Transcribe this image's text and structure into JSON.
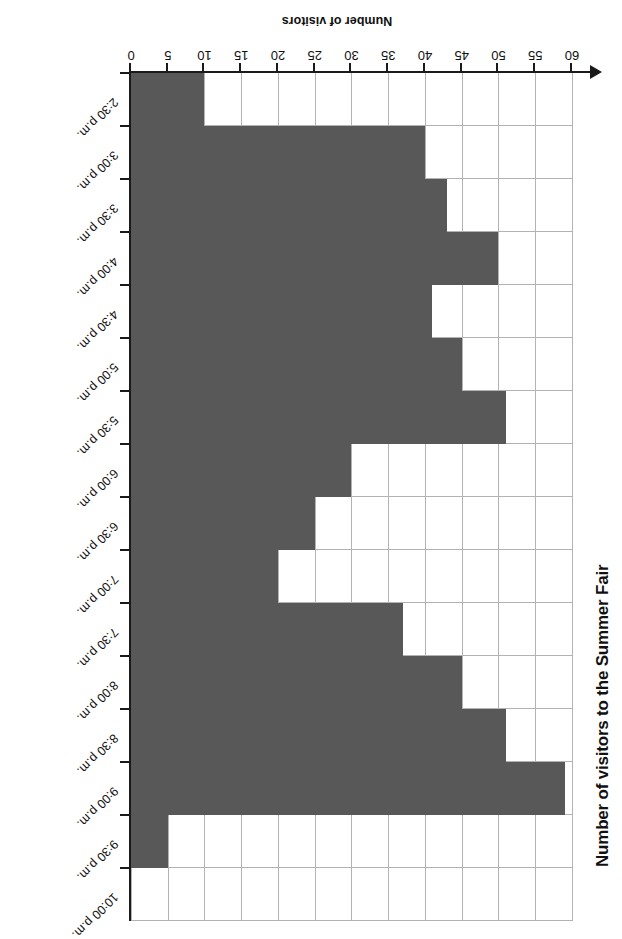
{
  "chart_data": {
    "type": "bar",
    "orientation": "horizontal",
    "title": "Number of visitors to the Summer Fair",
    "xlabel": "Number of visitors",
    "ylabel": "",
    "categories": [
      "2:30 p.m.",
      "3:00 p.m.",
      "3:30 p.m.",
      "4:00 p.m.",
      "4:30 p.m.",
      "5:00 p.m.",
      "5:30 p.m.",
      "6:00 p.m.",
      "6:30 p.m.",
      "7:00 p.m.",
      "7:30 p.m.",
      "8:00 p.m.",
      "8:30 p.m.",
      "9:00 p.m.",
      "9:30 p.m.",
      "10:00 p.m."
    ],
    "values": [
      10,
      40,
      43,
      50,
      41,
      45,
      51,
      30,
      25,
      20,
      37,
      45,
      51,
      59,
      5,
      0
    ],
    "xlim": [
      0,
      60
    ],
    "xticks": [
      0,
      5,
      10,
      15,
      20,
      25,
      30,
      35,
      40,
      45,
      50,
      55,
      60
    ],
    "xtick_labels": [
      "0",
      "5",
      "10",
      "15",
      "20",
      "25",
      "30",
      "35",
      "40",
      "45",
      "50",
      "55",
      "60"
    ],
    "grid": true,
    "legend": false,
    "bar_color": "#585858",
    "grid_color": "#b3b3b3",
    "axis_color": "#1a1a1a",
    "rotated_180": true
  }
}
